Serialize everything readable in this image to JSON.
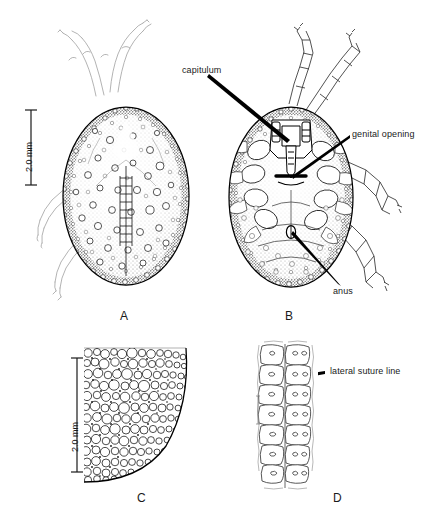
{
  "figure": {
    "background_color": "#ffffff",
    "ink_color": "#000000",
    "panels": [
      {
        "id": "A",
        "letter": "A",
        "view": "dorsal",
        "description": "dorsal view of engorged soft tick body, ovoid, covered in mammillae and discs, with faint legs at upper left"
      },
      {
        "id": "B",
        "letter": "B",
        "view": "ventral",
        "description": "ventral view showing capitulum, genital opening, anus and four pairs of legs"
      },
      {
        "id": "C",
        "letter": "C",
        "view": "integument-detail",
        "description": "quarter section enlargement of body integument showing mammillae and tubercles"
      },
      {
        "id": "D",
        "letter": "D",
        "view": "lateral-suture-detail",
        "description": "enlargement of body margin showing lateral suture line between two columns of cells"
      }
    ],
    "callouts": [
      {
        "id": "capitulum",
        "text": "capitulum",
        "panel": "B"
      },
      {
        "id": "genital-opening",
        "text": "genital opening",
        "panel": "B"
      },
      {
        "id": "anus",
        "text": "anus",
        "panel": "B"
      },
      {
        "id": "lateral-suture-line",
        "text": "lateral suture line",
        "panel": "D"
      }
    ],
    "scale_bars": [
      {
        "id": "scale-ab",
        "label": "2.0 mm",
        "applies_to": "A and B"
      },
      {
        "id": "scale-c",
        "label": "2.0 mm",
        "applies_to": "C"
      }
    ]
  }
}
